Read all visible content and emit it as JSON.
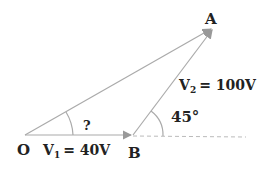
{
  "diagram": {
    "points": {
      "O": {
        "label": "O",
        "x": 25,
        "y": 135
      },
      "B": {
        "label": "B",
        "x": 133,
        "y": 135
      },
      "A": {
        "label": "A",
        "x": 213,
        "y": 28
      }
    },
    "vectors": [
      {
        "from": "O",
        "to": "B",
        "label": "V",
        "subscript": "1",
        "value": "= 40V"
      },
      {
        "from": "B",
        "to": "A",
        "label": "V",
        "subscript": "2",
        "value": "= 100V"
      },
      {
        "from": "O",
        "to": "A",
        "label": ""
      }
    ],
    "angles": [
      {
        "at": "O",
        "label": "?"
      },
      {
        "at": "B",
        "label": "45°"
      }
    ],
    "colors": {
      "line": "#aaaaaa",
      "text": "#222222"
    }
  }
}
